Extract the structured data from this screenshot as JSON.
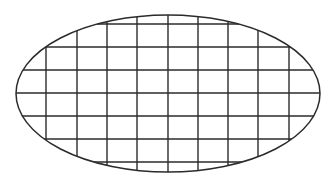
{
  "diagram": {
    "type": "ellipse-grid",
    "background": "#ffffff",
    "stroke_color": "#2b2b2b",
    "ellipse": {
      "cx": 168,
      "cy": 93.5,
      "rx": 152,
      "ry": 78.5,
      "stroke_width": 1.5
    },
    "grid": {
      "vertical_x": [
        46,
        77,
        107,
        137,
        168,
        198,
        228,
        258,
        289
      ],
      "horizontal_y": [
        24,
        47,
        70,
        93,
        116,
        139,
        162
      ],
      "stroke_width": 1.4
    }
  }
}
